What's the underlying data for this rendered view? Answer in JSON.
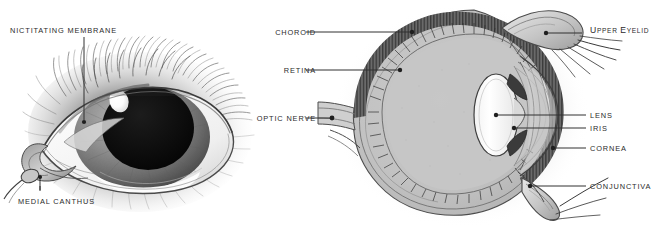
{
  "figure": {
    "type": "anatomical-diagram",
    "background_color": "#ffffff",
    "ink_color": "#2b2b2b",
    "panels": [
      {
        "id": "photo",
        "kind": "shaded-drawing",
        "description": "three-quarter external view of an animal eye surrounded by fur",
        "labels": [
          {
            "id": "nictitating-membrane",
            "text": "NICTITATING MEMBRANE",
            "side": "top-left",
            "leader": "vertical"
          },
          {
            "id": "medial-canthus",
            "text": "MEDIAL CANTHUS",
            "side": "bottom-left",
            "leader": "vertical"
          }
        ]
      },
      {
        "id": "section",
        "kind": "cross-section",
        "description": "sagittal cross-section of the eyeball showing internal layers",
        "labels_left": [
          {
            "id": "choroid",
            "text": "CHOROID"
          },
          {
            "id": "retina",
            "text": "RETINA"
          },
          {
            "id": "optic-nerve",
            "text": "OPTIC NERVE"
          }
        ],
        "labels_right": [
          {
            "id": "upper-eyelid",
            "text": "UPPER EYELID",
            "style": "small-caps",
            "cap": "U",
            "rest_cap": "E"
          },
          {
            "id": "lens",
            "text": "LENS"
          },
          {
            "id": "iris",
            "text": "IRIS"
          },
          {
            "id": "cornea",
            "text": "CORNEA"
          },
          {
            "id": "conjunctiva",
            "text": "CONJUNCTIVA"
          }
        ],
        "structures": [
          {
            "name": "sclera",
            "tone": "white-outline"
          },
          {
            "name": "choroid",
            "tone": "dark-hatched-band"
          },
          {
            "name": "retina",
            "tone": "thin-inner-line"
          },
          {
            "name": "vitreous-body",
            "tone": "light-grey-fill"
          },
          {
            "name": "lens",
            "tone": "white-lenticular"
          },
          {
            "name": "iris",
            "tone": "dark-wedge"
          },
          {
            "name": "cornea",
            "tone": "clear-arc"
          },
          {
            "name": "conjunctiva",
            "tone": "thin-fold"
          },
          {
            "name": "upper-eyelid",
            "tone": "shaded-hook"
          },
          {
            "name": "lower-eyelid",
            "tone": "shaded-hook"
          },
          {
            "name": "optic-nerve",
            "tone": "tapering-stalk"
          }
        ]
      }
    ]
  },
  "upper_eyelid_parts": {
    "first": "U",
    "small1": "PPER",
    "second": "E",
    "small2": "YELID"
  }
}
